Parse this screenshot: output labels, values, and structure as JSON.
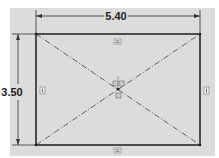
{
  "drawing": {
    "type": "sketch-rectangle",
    "width_dimension": "5.40",
    "height_dimension": "3.50",
    "relations": {
      "horizontal_top": "=",
      "horizontal_bottom": "=",
      "vertical_left": "|",
      "vertical_right": "|"
    },
    "construction_lines": "diagonals (center-point)",
    "colors": {
      "background": "#dcdcdc",
      "sketch_line": "#2a2a2a",
      "construction_line": "#555555"
    }
  }
}
